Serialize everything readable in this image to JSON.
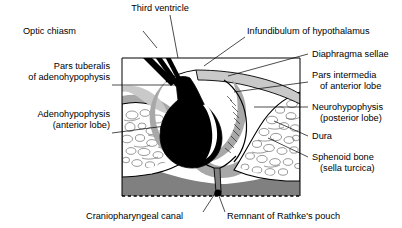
{
  "figure": {
    "type": "anatomical-diagram",
    "colors": {
      "gland_black": "#000000",
      "diaphragma_gray": "#c9c9c9",
      "dura_gray": "#a8a8a8",
      "deep_tissue_gray": "#808080",
      "bone_white": "#ffffff",
      "outline": "#000000",
      "background": "#ffffff"
    },
    "frame": {
      "left": 122,
      "top": 58,
      "right": 300,
      "bottom": 196,
      "bottom_edge_style": "dashed"
    }
  },
  "labels": {
    "third_ventricle": {
      "lines": [
        "Third ventricle"
      ],
      "position": "top-center",
      "text_x": 160,
      "text_y": 11,
      "leader": "M 170 15 L 178 58"
    },
    "optic_chiasm": {
      "lines": [
        "Optic chiasm"
      ],
      "position": "top-left",
      "text_x": 76,
      "text_y": 34,
      "leader": "M 143 31 L 157 48"
    },
    "infundibulum": {
      "lines": [
        "Infundibulum of hypothalamus"
      ],
      "position": "top-right",
      "text_x": 247,
      "text_y": 34,
      "leader": "M 245 37 L 204 66"
    },
    "diaphragma_sellae": {
      "lines": [
        "Diaphragma sellae"
      ],
      "position": "right",
      "text_x": 312,
      "text_y": 57,
      "leader": "M 308 54 L 228 76"
    },
    "pars_tuberalis": {
      "lines": [
        "Pars tuberalis",
        "of adenohypophysis"
      ],
      "position": "left",
      "text_x": 110,
      "text_y": 69,
      "leader": "M 112 85 L 176 85"
    },
    "pars_intermedia": {
      "lines": [
        "Pars intermedia",
        "of anterior lobe"
      ],
      "position": "right",
      "text_x": 312,
      "text_y": 78,
      "leader": "M 308 82 L 234 92"
    },
    "neurohypophysis": {
      "lines": [
        "Neurohypophysis",
        "(posterior lobe)"
      ],
      "position": "right",
      "text_x": 312,
      "text_y": 110,
      "leader": "M 308 107 L 254 107"
    },
    "adenohypophysis": {
      "lines": [
        "Adenohypophysis",
        "(anterior lobe)"
      ],
      "position": "left",
      "text_x": 110,
      "text_y": 117,
      "leader": "M 112 133 L 196 122"
    },
    "dura": {
      "lines": [
        "Dura"
      ],
      "position": "right",
      "text_x": 312,
      "text_y": 139,
      "leader": "M 308 136 L 274 121"
    },
    "sphenoid_bone": {
      "lines": [
        "Sphenoid bone",
        "(sella turcica)"
      ],
      "position": "right",
      "text_x": 312,
      "text_y": 160,
      "leader": "M 308 157 L 268 138"
    },
    "craniopharyngeal_canal": {
      "lines": [
        "Craniopharyngeal canal"
      ],
      "position": "bottom-left",
      "text_x": 86,
      "text_y": 219,
      "leader": "M 203 212 L 216 192"
    },
    "rathkes_pouch": {
      "lines": [
        "Remnant of Rathke's pouch"
      ],
      "position": "bottom-right",
      "text_x": 227,
      "text_y": 219,
      "leader": "M 225 212 L 219 196"
    }
  },
  "structures": {
    "pituitary_gland": "black-filled hypophysis with stalk",
    "hypophyseal_cleft": "white crescent within gland",
    "diaphragma_sellae_band": "light gray band above gland",
    "dura_mater": "gray lining of sella",
    "sphenoid_trabecular_bone": "white cancellous bone with cell outlines",
    "deep_tissue": "medium gray region below sella floor",
    "rathkes_pouch_dot": "small black dot at sella floor on dashed edge"
  }
}
